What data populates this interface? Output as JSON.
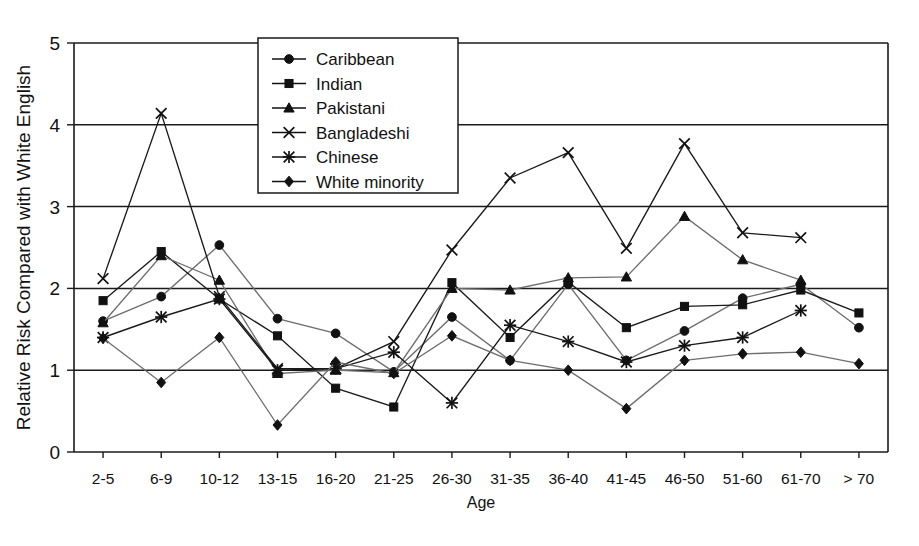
{
  "chart_data": {
    "type": "line",
    "title": "",
    "xlabel": "Age",
    "ylabel": "Relative Risk Compared with White English",
    "ylim": [
      0,
      5
    ],
    "yticks": [
      0,
      1,
      2,
      3,
      4,
      5
    ],
    "grid": "horizontal",
    "legend_position": "top-center-inside",
    "categories": [
      "2-5",
      "6-9",
      "10-12",
      "13-15",
      "16-20",
      "21-25",
      "26-30",
      "31-35",
      "36-40",
      "41-45",
      "46-50",
      "51-60",
      "61-70",
      "> 70"
    ],
    "series": [
      {
        "name": "Caribbean",
        "marker": "circle",
        "values": [
          1.6,
          1.9,
          2.53,
          1.63,
          1.45,
          0.98,
          1.65,
          1.12,
          2.05,
          1.12,
          1.48,
          1.88,
          2.05,
          1.52
        ]
      },
      {
        "name": "Indian",
        "marker": "square",
        "values": [
          1.85,
          2.45,
          1.87,
          1.42,
          0.78,
          0.55,
          2.07,
          1.4,
          2.08,
          1.52,
          1.78,
          1.8,
          1.98,
          1.7
        ]
      },
      {
        "name": "Pakistani",
        "marker": "triangle",
        "values": [
          1.58,
          2.4,
          2.1,
          0.96,
          1.0,
          0.97,
          2.0,
          1.98,
          2.13,
          2.14,
          2.88,
          2.35,
          2.1,
          null
        ]
      },
      {
        "name": "Bangladeshi",
        "marker": "cross",
        "values": [
          2.12,
          4.14,
          1.9,
          1.02,
          1.02,
          1.35,
          2.47,
          3.35,
          3.66,
          2.49,
          3.77,
          2.68,
          2.62,
          null
        ]
      },
      {
        "name": "Chinese",
        "marker": "star",
        "values": [
          1.4,
          1.65,
          1.87,
          1.0,
          1.02,
          1.22,
          0.6,
          1.55,
          1.35,
          1.1,
          1.3,
          1.4,
          1.73,
          null
        ]
      },
      {
        "name": "White minority",
        "marker": "diamond",
        "values": [
          1.39,
          0.85,
          1.4,
          0.33,
          1.1,
          0.96,
          1.42,
          1.12,
          1.0,
          0.53,
          1.12,
          1.2,
          1.22,
          1.08
        ]
      }
    ]
  },
  "legend": {
    "items": [
      {
        "label": "Caribbean",
        "marker": "circle"
      },
      {
        "label": "Indian",
        "marker": "square"
      },
      {
        "label": "Pakistani",
        "marker": "triangle"
      },
      {
        "label": "Bangladeshi",
        "marker": "cross"
      },
      {
        "label": "Chinese",
        "marker": "star"
      },
      {
        "label": "White minority",
        "marker": "diamond"
      }
    ]
  },
  "colors": {
    "ink": "#111111",
    "background": "#ffffff",
    "series_dark": "#1a1a1a",
    "series_gray": "#6e6e6e"
  }
}
